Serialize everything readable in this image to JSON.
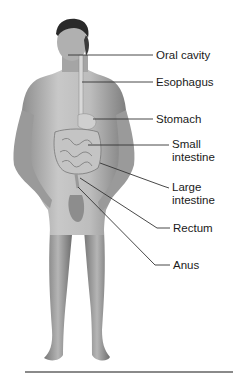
{
  "figure": {
    "labels": [
      {
        "id": "oral-cavity",
        "text": "Oral cavity",
        "x": 156,
        "y": 49
      },
      {
        "id": "esophagus",
        "text": "Esophagus",
        "x": 156,
        "y": 76
      },
      {
        "id": "stomach",
        "text": "Stomach",
        "x": 156,
        "y": 113
      },
      {
        "id": "small-intestine",
        "text": "Small\nintestine",
        "line1": "Small",
        "line2": "intestine",
        "x": 172,
        "y": 138
      },
      {
        "id": "large-intestine",
        "text": "Large\nintestine",
        "line1": "Large",
        "line2": "intestine",
        "x": 172,
        "y": 183
      },
      {
        "id": "rectum",
        "text": "Rectum",
        "x": 173,
        "y": 222
      },
      {
        "id": "anus",
        "text": "Anus",
        "x": 173,
        "y": 259
      }
    ],
    "colors": {
      "skin": "#b8b8b8",
      "skin_dark": "#7a7a7a",
      "hair": "#2a2a2a",
      "leader_line": "#333333",
      "rule": "#8a8a8a"
    }
  }
}
